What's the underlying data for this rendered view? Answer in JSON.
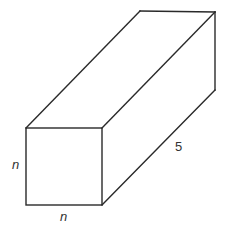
{
  "figure": {
    "colors": {
      "stroke": "#2a2a2a",
      "label": "#333333",
      "background": "#ffffff"
    },
    "labels": {
      "front_height": "n",
      "front_width": "n",
      "length": "5"
    }
  }
}
